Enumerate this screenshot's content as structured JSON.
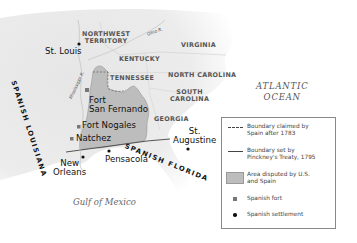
{
  "map": {
    "colors": {
      "water": "#ffffff",
      "land": "#e9e9e9",
      "disputed_area": "#bdbdbd",
      "boundary": "#555555",
      "fort": "#777777",
      "settlement": "#111111"
    },
    "regions": {
      "northwest_territory": "NORTHWEST\nTERRITORY",
      "kentucky": "KENTUCKY",
      "virginia": "VIRGINIA",
      "tennessee": "TENNESSEE",
      "north_carolina": "NORTH CAROLINA",
      "south_carolina": "SOUTH\nCAROLINA",
      "georgia": "GEORGIA",
      "spanish_louisiana": "SPANISH LOUISIANA",
      "spanish_florida": "SPANISH FLORIDA"
    },
    "rivers": {
      "ohio": "Ohio R.",
      "mississippi": "Mississippi R."
    },
    "water_bodies": {
      "atlantic": "ATLANTIC\nOCEAN",
      "gulf": "Gulf of Mexico"
    },
    "places": [
      {
        "name": "St. Louis",
        "type": "settlement"
      },
      {
        "name": "Fort\nSan Fernando",
        "type": "fort"
      },
      {
        "name": "Fort Nogales",
        "type": "fort"
      },
      {
        "name": "Natchez",
        "type": "fort"
      },
      {
        "name": "New\nOrleans",
        "type": "settlement"
      },
      {
        "name": "Pensacola",
        "type": "settlement"
      },
      {
        "name": "St.\nAugustine",
        "type": "settlement"
      }
    ]
  },
  "legend": {
    "items": [
      {
        "symbol": "dashed-line",
        "label": "Boundary claimed by\nSpain after 1783"
      },
      {
        "symbol": "solid-line",
        "label": "Boundary set by\nPinckney's Treaty, 1795"
      },
      {
        "symbol": "gray-swatch",
        "label": "Area disputed by U.S.\nand Spain"
      },
      {
        "symbol": "square",
        "label": "Spanish fort"
      },
      {
        "symbol": "dot",
        "label": "Spanish settlement"
      }
    ]
  }
}
